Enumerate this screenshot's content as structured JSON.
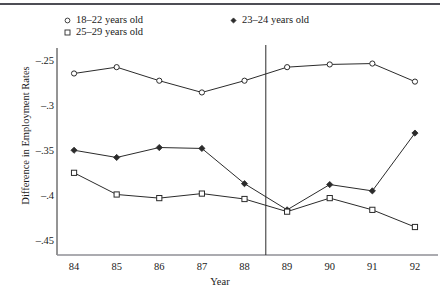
{
  "chart_data": {
    "type": "line",
    "title": "",
    "xlabel": "Year",
    "ylabel": "Difference in Employment Rates",
    "x": [
      84,
      85,
      86,
      87,
      88,
      89,
      90,
      91,
      92
    ],
    "xtick_labels": [
      "84",
      "85",
      "86",
      "87",
      "88",
      "89",
      "90",
      "91",
      "92"
    ],
    "ytick_labels": [
      "–.25",
      "–.3",
      "–.35",
      "–.4",
      "–.45"
    ],
    "ytick_values": [
      -0.25,
      -0.3,
      -0.35,
      -0.4,
      -0.45
    ],
    "ylim": [
      -0.465,
      -0.238
    ],
    "xlim": [
      83.6,
      92.4
    ],
    "grid": false,
    "legend_position": "top",
    "series": [
      {
        "name": "18–22 years old",
        "marker": "circle-open",
        "color": "#2b2b2b",
        "values": [
          -0.264,
          -0.257,
          -0.272,
          -0.285,
          -0.272,
          -0.257,
          -0.254,
          -0.253,
          -0.273
        ]
      },
      {
        "name": "23–24 years old",
        "marker": "diamond-filled",
        "color": "#2b2b2b",
        "values": [
          -0.349,
          -0.357,
          -0.346,
          -0.347,
          -0.386,
          -0.415,
          -0.387,
          -0.394,
          -0.33
        ]
      },
      {
        "name": "25–29 years old",
        "marker": "square-open",
        "color": "#2b2b2b",
        "values": [
          -0.374,
          -0.398,
          -0.402,
          -0.397,
          -0.403,
          -0.417,
          -0.402,
          -0.415,
          -0.434
        ]
      }
    ],
    "annotations": [
      {
        "type": "vertical-reference-line",
        "x": 88.5,
        "label": ""
      }
    ]
  }
}
